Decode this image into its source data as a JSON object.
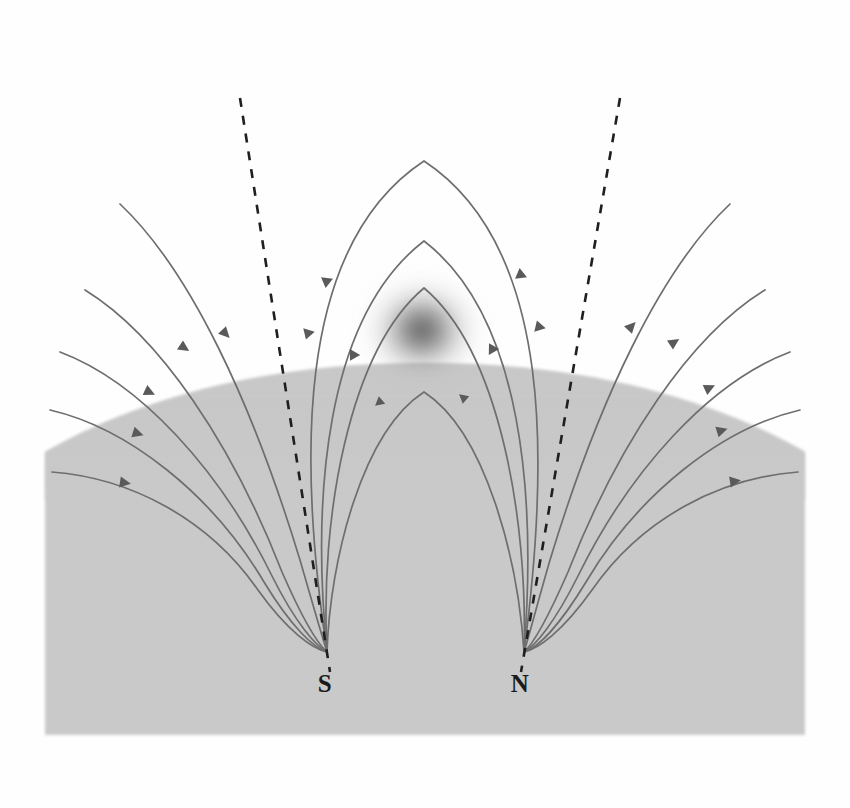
{
  "figure": {
    "domain_kind": "Diagram",
    "canvas": {
      "width": 850,
      "height": 808
    },
    "background_color": "#fefefe"
  },
  "solar_body": {
    "name": "solar-surface",
    "fill_color": "#c9c9c9",
    "edge_softness": "grainy-halftone",
    "limb_apex": {
      "x": 425,
      "y": 363
    },
    "limb_left_edge": {
      "x": 45,
      "y": 452
    },
    "limb_right_edge": {
      "x": 805,
      "y": 452
    },
    "body_bottom": {
      "y": 735
    },
    "body_left": {
      "x": 45
    },
    "body_right": {
      "x": 805
    }
  },
  "prominence": {
    "name": "dark-prominence-cloud",
    "center": {
      "x": 422,
      "y": 330
    },
    "radius_x": 46,
    "radius_y": 42,
    "core_color": "#555555",
    "halo_color": "#b6b6b6",
    "description": "diffuse dark absorbing cloud above the surface"
  },
  "poles": [
    {
      "id": "south-pole",
      "label": "S",
      "polarity": "negative",
      "field_direction": "inward",
      "label_position": {
        "x": 325,
        "y": 690
      },
      "convergence_point": {
        "x": 327,
        "y": 652
      },
      "axis_dashed_line": {
        "x1": 240,
        "y1": 98,
        "x2": 330,
        "y2": 672
      }
    },
    {
      "id": "north-pole",
      "label": "N",
      "polarity": "positive",
      "field_direction": "outward",
      "label_position": {
        "x": 520,
        "y": 690
      },
      "convergence_point": {
        "x": 524,
        "y": 652
      },
      "axis_dashed_line": {
        "x1": 620,
        "y1": 98,
        "x2": 521,
        "y2": 672
      }
    }
  ],
  "field_line_style": {
    "stroke_color": "#6e6e6e",
    "stroke_width": 1.7,
    "arrow_color": "#5a5a5a",
    "arrow_length": 11,
    "arrow_half_width": 4.5
  },
  "dashed_line_style": {
    "stroke_color": "#1f1f1f",
    "stroke_width": 2.6,
    "dash_pattern": "9 9"
  },
  "closed_loops": [
    {
      "id": "closed-loop-1",
      "apex": {
        "x": 424,
        "y": 161
      },
      "half_width": 127,
      "note": "outermost closed arch"
    },
    {
      "id": "closed-loop-2",
      "apex": {
        "x": 424,
        "y": 241
      },
      "half_width": 92,
      "note": "middle closed arch"
    },
    {
      "id": "closed-loop-3",
      "apex": {
        "x": 424,
        "y": 288
      },
      "half_width": 62,
      "note": "inner closed arch straddling prominence"
    },
    {
      "id": "closed-loop-4",
      "apex": {
        "x": 424,
        "y": 392
      },
      "half_width": 46,
      "note": "smallest arch, below the limb"
    }
  ],
  "open_lines_left": [
    {
      "id": "open-left-1",
      "start": {
        "x": 120,
        "y": 204
      }
    },
    {
      "id": "open-left-2",
      "start": {
        "x": 85,
        "y": 290
      }
    },
    {
      "id": "open-left-3",
      "start": {
        "x": 60,
        "y": 352
      }
    },
    {
      "id": "open-left-4",
      "start": {
        "x": 50,
        "y": 410
      }
    },
    {
      "id": "open-left-5",
      "start": {
        "x": 52,
        "y": 472
      }
    }
  ],
  "open_lines_right": [
    {
      "id": "open-right-1",
      "start": {
        "x": 730,
        "y": 204
      }
    },
    {
      "id": "open-right-2",
      "start": {
        "x": 765,
        "y": 290
      }
    },
    {
      "id": "open-right-3",
      "start": {
        "x": 790,
        "y": 352
      }
    },
    {
      "id": "open-right-4",
      "start": {
        "x": 800,
        "y": 410
      }
    },
    {
      "id": "open-right-5",
      "start": {
        "x": 798,
        "y": 472
      }
    }
  ],
  "legend_text": {
    "south_label": "S",
    "north_label": "N"
  }
}
